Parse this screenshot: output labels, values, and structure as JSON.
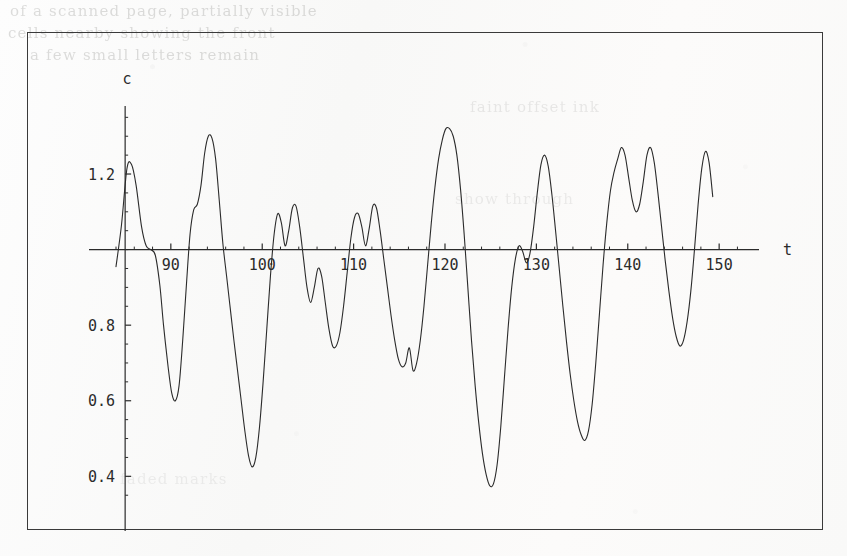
{
  "page": {
    "background_color": "#fbfaf9",
    "ink_color": "#2b2b2b",
    "ghost_text": {
      "line1": "of a scanned page, partially visible",
      "line2": "cells nearby   showing the front",
      "line3": "a few   small   letters   remain",
      "right1": "faint  offset  ink",
      "right2": "show through",
      "bottom1": "faded marks"
    }
  },
  "figure": {
    "frame": {
      "x": 27,
      "y": 32,
      "width": 796,
      "height": 498,
      "border_color": "#3a3a3a"
    },
    "xlabel": "t",
    "ylabel": "c"
  },
  "chart_data": {
    "type": "line",
    "title": "",
    "xlabel": "t",
    "ylabel": "c",
    "xlim": [
      84.0,
      152.5
    ],
    "ylim": [
      0.34,
      1.38
    ],
    "xticks": [
      90,
      100,
      110,
      120,
      130,
      140,
      150
    ],
    "xticklabels": [
      "90",
      "100",
      "110",
      "120",
      "130",
      "140",
      "150"
    ],
    "yticks": [
      0.4,
      0.6,
      0.8,
      1.2
    ],
    "yticklabels": [
      "0.4",
      "0.6",
      "0.8",
      "1.2"
    ],
    "y_minor_step": 0.05,
    "x_minor_step": 2,
    "grid": false,
    "legend": null,
    "axis_style": "mathematica-centered-cross",
    "baseline_value": 1.0,
    "series": [
      {
        "name": "c(t)",
        "color": "#2b2b2b",
        "linewidth": 1.1,
        "x": [
          84.0,
          84.6,
          85.2,
          85.7,
          86.2,
          86.8,
          87.3,
          87.8,
          88.3,
          88.8,
          89.2,
          89.7,
          90.1,
          90.5,
          90.9,
          91.3,
          91.7,
          92.1,
          92.5,
          92.9,
          93.3,
          93.7,
          94.1,
          94.5,
          94.9,
          95.3,
          95.7,
          96.1,
          96.5,
          96.9,
          97.3,
          97.7,
          98.1,
          98.5,
          98.9,
          99.3,
          99.7,
          100.1,
          100.5,
          100.9,
          101.3,
          101.7,
          102.1,
          102.5,
          102.9,
          103.3,
          103.7,
          104.1,
          104.5,
          104.9,
          105.3,
          105.7,
          106.1,
          106.5,
          106.9,
          107.3,
          107.7,
          108.1,
          108.5,
          108.9,
          109.3,
          109.7,
          110.1,
          110.5,
          110.9,
          111.3,
          111.7,
          112.1,
          112.5,
          112.9,
          113.3,
          113.7,
          114.1,
          114.5,
          114.9,
          115.3,
          115.7,
          116.1,
          116.5,
          116.9,
          117.3,
          117.7,
          118.1,
          118.5,
          118.9,
          119.3,
          119.7,
          120.1,
          120.5,
          120.9,
          121.3,
          121.7,
          122.1,
          122.5,
          122.9,
          123.3,
          123.7,
          124.1,
          124.5,
          124.9,
          125.3,
          125.7,
          126.1,
          126.5,
          126.9,
          127.3,
          127.7,
          128.1,
          128.5,
          128.9,
          129.3,
          129.7,
          130.1,
          130.5,
          130.9,
          131.3,
          131.7,
          132.1,
          132.5,
          132.9,
          133.3,
          133.7,
          134.1,
          134.5,
          134.9,
          135.3,
          135.7,
          136.1,
          136.5,
          136.9,
          137.3,
          137.7,
          138.1,
          138.5,
          138.9,
          139.3,
          139.7,
          140.1,
          140.5,
          140.9,
          141.3,
          141.7,
          142.1,
          142.5,
          142.9,
          143.3,
          143.7,
          144.1,
          144.5,
          144.9,
          145.3,
          145.7,
          146.1,
          146.5,
          146.9,
          147.3,
          147.7,
          148.1,
          148.5,
          148.9,
          149.3
        ],
        "y": [
          0.955,
          1.065,
          1.215,
          1.225,
          1.17,
          1.06,
          1.01,
          1.0,
          0.985,
          0.905,
          0.8,
          0.69,
          0.62,
          0.6,
          0.64,
          0.76,
          0.905,
          1.04,
          1.105,
          1.12,
          1.17,
          1.255,
          1.3,
          1.295,
          1.24,
          1.13,
          1.015,
          0.93,
          0.845,
          0.76,
          0.68,
          0.6,
          0.52,
          0.455,
          0.425,
          0.45,
          0.53,
          0.65,
          0.79,
          0.93,
          1.04,
          1.095,
          1.07,
          1.01,
          1.05,
          1.11,
          1.115,
          1.06,
          0.98,
          0.9,
          0.86,
          0.9,
          0.95,
          0.93,
          0.86,
          0.79,
          0.745,
          0.745,
          0.78,
          0.85,
          0.94,
          1.03,
          1.085,
          1.095,
          1.06,
          1.01,
          1.055,
          1.115,
          1.11,
          1.05,
          0.975,
          0.9,
          0.825,
          0.76,
          0.71,
          0.69,
          0.7,
          0.74,
          0.68,
          0.7,
          0.76,
          0.85,
          0.96,
          1.07,
          1.165,
          1.24,
          1.29,
          1.32,
          1.32,
          1.3,
          1.25,
          1.16,
          1.04,
          0.9,
          0.76,
          0.64,
          0.54,
          0.46,
          0.405,
          0.375,
          0.38,
          0.43,
          0.53,
          0.66,
          0.79,
          0.9,
          0.975,
          1.01,
          0.995,
          0.965,
          0.99,
          1.06,
          1.15,
          1.225,
          1.25,
          1.22,
          1.145,
          1.05,
          0.95,
          0.85,
          0.755,
          0.67,
          0.6,
          0.545,
          0.51,
          0.495,
          0.52,
          0.59,
          0.7,
          0.83,
          0.96,
          1.07,
          1.155,
          1.205,
          1.24,
          1.27,
          1.25,
          1.19,
          1.13,
          1.1,
          1.12,
          1.18,
          1.25,
          1.27,
          1.23,
          1.15,
          1.06,
          0.97,
          0.89,
          0.82,
          0.77,
          0.745,
          0.76,
          0.81,
          0.89,
          1.0,
          1.12,
          1.215,
          1.26,
          1.23,
          1.14
        ]
      }
    ]
  }
}
